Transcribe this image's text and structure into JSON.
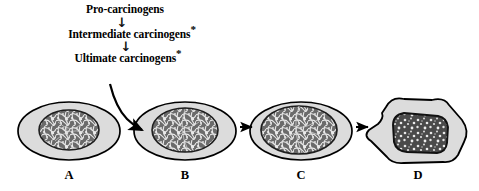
{
  "figure": {
    "type": "biological-process-diagram"
  },
  "pathway": {
    "step1": "Pro-carcinogens",
    "arrow1": "↓",
    "step2": "Intermediate carcinogens",
    "step2_marker": "*",
    "arrow2": "↓",
    "step3": "Ultimate carcinogens",
    "step3_marker": "*"
  },
  "cells": [
    {
      "label": "A",
      "stage": "normal-cell",
      "shape": "ellipse",
      "nucleus_size": "small"
    },
    {
      "label": "B",
      "stage": "initiated-cell",
      "shape": "ellipse",
      "nucleus_size": "medium"
    },
    {
      "label": "C",
      "stage": "dysplastic-cell",
      "shape": "ellipse",
      "nucleus_size": "large"
    },
    {
      "label": "D",
      "stage": "malignant-cell",
      "shape": "irregular-polygon",
      "nucleus_size": "large-angular"
    }
  ],
  "arrows": {
    "curved_to_b": "curved-arrow",
    "b_to_c": "straight-arrow",
    "c_to_d": "straight-arrow"
  },
  "colors": {
    "cytoplasm": "#dcdcdc",
    "nucleus": "#5a5a5a",
    "outline": "#000000",
    "text": "#000000"
  }
}
